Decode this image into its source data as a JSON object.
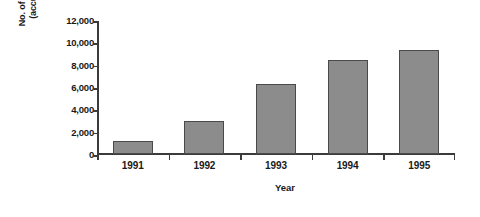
{
  "chart_data": {
    "type": "bar",
    "title": "",
    "subtitle": "",
    "xlabel": "Year",
    "ylabel": "No. of enterprises (accumulated)",
    "ylabel_lines": [
      "No. of enterprises",
      "(accumulated)"
    ],
    "categories": [
      "1991",
      "1992",
      "1993",
      "1994",
      "1995"
    ],
    "values": [
      1200,
      3000,
      6300,
      8400,
      9300
    ],
    "series": [
      {
        "name": "No. of enterprises (accumulated)",
        "values": [
          1200,
          3000,
          6300,
          8400,
          9300
        ]
      }
    ],
    "ylim": [
      0,
      12000
    ],
    "ytick_values": [
      0,
      2000,
      4000,
      6000,
      8000,
      10000,
      12000
    ],
    "ytick_labels": [
      "0",
      "2,000",
      "4,000",
      "6,000",
      "8,000",
      "10,000",
      "12,000"
    ],
    "xtick_labels": [
      "1991",
      "1992",
      "1993",
      "1994",
      "1995"
    ],
    "grid": false,
    "legend": false,
    "legend_position": "none",
    "annotations": [],
    "colors": {
      "bar_fill": "#8c8c8c",
      "bar_border": "#4a4a4a",
      "axis": "#3b3b3b",
      "text": "#1a1a1a",
      "background": "#ffffff"
    }
  }
}
